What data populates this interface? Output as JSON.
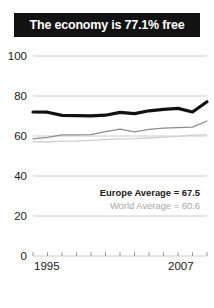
{
  "title": "The economy is 77.1% free",
  "legend": {
    "europe_label": "Europe Average = 67.5",
    "world_label": "World Average = 60.6"
  },
  "axis": {
    "y_ticks": [
      "100",
      "80",
      "60",
      "40",
      "20",
      "0"
    ],
    "x_start": "1995",
    "x_end": "2007"
  },
  "colors": {
    "banner_bg": "#121212",
    "banner_text": "#ffffff",
    "country_line": "#111111",
    "europe_line": "#8d8d8d",
    "world_line": "#cfcfcf",
    "gridline": "#cccccc"
  },
  "chart_data": {
    "type": "line",
    "title": "The economy is 77.1% free",
    "xlabel": "",
    "ylabel": "",
    "ylim": [
      0,
      100
    ],
    "yticks": [
      0,
      20,
      40,
      60,
      80,
      100
    ],
    "grid": true,
    "legend_position": "inside-right",
    "x": [
      1995,
      1996,
      1997,
      1998,
      1999,
      2000,
      2001,
      2002,
      2003,
      2004,
      2005,
      2006,
      2007
    ],
    "xtick_labels": [
      "1995",
      "",
      "",
      "",
      "",
      "",
      "",
      "",
      "",
      "",
      "",
      "",
      "2007"
    ],
    "series": [
      {
        "name": "Country",
        "color": "#111111",
        "width": 3.2,
        "values": [
          72.0,
          71.9,
          70.3,
          70.2,
          70.1,
          70.4,
          71.8,
          71.2,
          72.6,
          73.3,
          73.8,
          72.0,
          77.1
        ]
      },
      {
        "name": "Europe Average",
        "color": "#8d8d8d",
        "width": 1.3,
        "final_value": 67.5,
        "values": [
          58.6,
          59.3,
          60.6,
          60.6,
          60.7,
          62.2,
          63.4,
          62.1,
          63.3,
          63.9,
          64.2,
          64.4,
          67.5
        ]
      },
      {
        "name": "World Average",
        "color": "#cfcfcf",
        "width": 1.3,
        "final_value": 60.6,
        "values": [
          57.2,
          57.0,
          57.4,
          57.5,
          57.8,
          58.2,
          58.6,
          58.7,
          59.0,
          59.4,
          59.8,
          60.4,
          60.6
        ]
      }
    ]
  }
}
